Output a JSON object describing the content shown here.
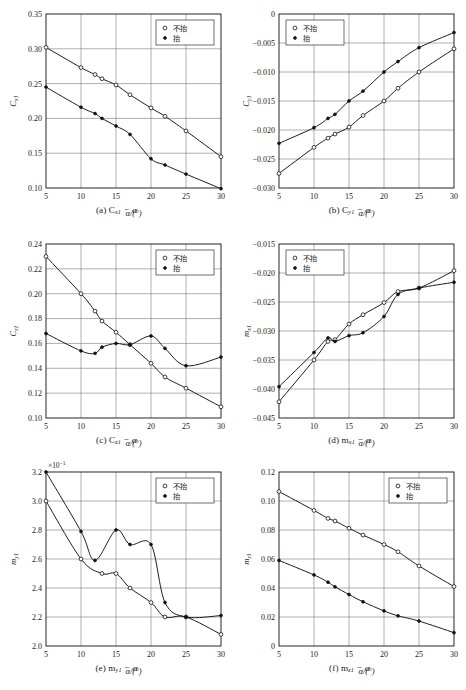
{
  "figure": {
    "panel_count": 6,
    "legend": {
      "open_label": "不抬",
      "filled_label": "抬"
    },
    "x_axis_title": "α/(°)",
    "series_names": [
      "不抬",
      "抬"
    ]
  },
  "captions": {
    "a": "(a) C",
    "a_sub": "x1",
    "a_tail": " − α",
    "b": "(b) C",
    "b_sub": "y1",
    "b_tail": " − α",
    "c": "(c) C",
    "c_sub": "z1",
    "c_tail": " − α",
    "d": "(d) m",
    "d_sub": "x1",
    "d_tail": " − α",
    "e": "(e) m",
    "e_sub": "y1",
    "e_tail": " − α",
    "f": "(f) m",
    "f_sub": "z1",
    "f_tail": " − α"
  },
  "chart_data": [
    {
      "id": "a",
      "type": "line",
      "title": "(a) Cx1 − α",
      "xlabel": "α/(°)",
      "ylabel": "C",
      "ylabel_sub": "x1",
      "xlim": [
        5,
        30
      ],
      "ylim": [
        0.1,
        0.35
      ],
      "xticks": [
        5,
        10,
        15,
        20,
        25,
        30
      ],
      "yticks": [
        0.1,
        0.15,
        0.2,
        0.25,
        0.3,
        0.35
      ],
      "ytick_labels": [
        "0.10",
        "0.15",
        "0.20",
        "0.25",
        "0.30",
        "0.35"
      ],
      "grid": true,
      "legend_position": "top-right",
      "multiplier": "",
      "series": [
        {
          "name": "不抬",
          "marker": "open-circle",
          "x": [
            5,
            10,
            12,
            13,
            15,
            17,
            20,
            22,
            25,
            30
          ],
          "values": [
            0.302,
            0.273,
            0.263,
            0.257,
            0.248,
            0.234,
            0.215,
            0.203,
            0.182,
            0.145
          ]
        },
        {
          "name": "抬",
          "marker": "filled-circle",
          "x": [
            5,
            10,
            12,
            13,
            15,
            17,
            20,
            22,
            25,
            30
          ],
          "values": [
            0.245,
            0.216,
            0.207,
            0.2,
            0.189,
            0.177,
            0.142,
            0.133,
            0.12,
            0.099
          ]
        }
      ]
    },
    {
      "id": "b",
      "type": "line",
      "title": "(b) Cy1 − α",
      "xlabel": "α/(°)",
      "ylabel": "C",
      "ylabel_sub": "y1",
      "xlim": [
        5,
        30
      ],
      "ylim": [
        -0.03,
        0
      ],
      "xticks": [
        5,
        10,
        15,
        20,
        25,
        30
      ],
      "yticks": [
        -0.03,
        -0.025,
        -0.02,
        -0.015,
        -0.01,
        -0.005,
        0
      ],
      "ytick_labels": [
        "−0.030",
        "−0.025",
        "−0.020",
        "−0.015",
        "−0.010",
        "−0.005",
        "0"
      ],
      "grid": true,
      "legend_position": "top-left",
      "multiplier": "",
      "series": [
        {
          "name": "不抬",
          "marker": "open-circle",
          "x": [
            5,
            10,
            12,
            13,
            15,
            17,
            20,
            22,
            25,
            30
          ],
          "values": [
            -0.0275,
            -0.023,
            -0.0214,
            -0.0207,
            -0.0195,
            -0.0175,
            -0.015,
            -0.0128,
            -0.01,
            -0.006
          ]
        },
        {
          "name": "抬",
          "marker": "filled-circle",
          "x": [
            5,
            10,
            12,
            13,
            15,
            17,
            20,
            22,
            25,
            30
          ],
          "values": [
            -0.0223,
            -0.0196,
            -0.018,
            -0.0173,
            -0.015,
            -0.0133,
            -0.01,
            -0.0082,
            -0.0058,
            -0.0032
          ]
        }
      ]
    },
    {
      "id": "c",
      "type": "line",
      "title": "(c) Cz1 − α",
      "xlabel": "α/(°)",
      "ylabel": "C",
      "ylabel_sub": "z1",
      "xlim": [
        5,
        30
      ],
      "ylim": [
        0.1,
        0.24
      ],
      "xticks": [
        5,
        10,
        15,
        20,
        25,
        30
      ],
      "yticks": [
        0.1,
        0.12,
        0.14,
        0.16,
        0.18,
        0.2,
        0.22,
        0.24
      ],
      "ytick_labels": [
        "0.10",
        "0.12",
        "0.14",
        "0.16",
        "0.18",
        "0.20",
        "0.22",
        "0.24"
      ],
      "grid": true,
      "legend_position": "top-right",
      "multiplier": "",
      "series": [
        {
          "name": "不抬",
          "marker": "open-circle",
          "x": [
            5,
            10,
            12,
            13,
            15,
            17,
            20,
            22,
            25,
            30
          ],
          "values": [
            0.23,
            0.2,
            0.186,
            0.178,
            0.169,
            0.159,
            0.144,
            0.133,
            0.124,
            0.109
          ]
        },
        {
          "name": "抬",
          "marker": "filled-circle",
          "x": [
            5,
            10,
            12,
            13,
            15,
            17,
            20,
            22,
            25,
            30
          ],
          "values": [
            0.168,
            0.154,
            0.152,
            0.157,
            0.16,
            0.159,
            0.166,
            0.156,
            0.142,
            0.149
          ]
        }
      ]
    },
    {
      "id": "d",
      "type": "line",
      "title": "(d) mx1 − α",
      "xlabel": "α/(°)",
      "ylabel": "m",
      "ylabel_sub": "x1",
      "xlim": [
        5,
        30
      ],
      "ylim": [
        -0.045,
        -0.015
      ],
      "xticks": [
        5,
        10,
        15,
        20,
        25,
        30
      ],
      "yticks": [
        -0.045,
        -0.04,
        -0.035,
        -0.03,
        -0.025,
        -0.02,
        -0.015
      ],
      "ytick_labels": [
        "−0.045",
        "−0.040",
        "−0.035",
        "−0.030",
        "−0.025",
        "−0.020",
        "−0.015"
      ],
      "grid": true,
      "legend_position": "top-left",
      "multiplier": "",
      "series": [
        {
          "name": "不抬",
          "marker": "open-circle",
          "x": [
            5,
            10,
            12,
            13,
            15,
            17,
            20,
            22,
            25,
            30
          ],
          "values": [
            -0.0422,
            -0.035,
            -0.0318,
            -0.0315,
            -0.0288,
            -0.0272,
            -0.0251,
            -0.0232,
            -0.0226,
            -0.0196
          ]
        },
        {
          "name": "抬",
          "marker": "filled-circle",
          "x": [
            5,
            10,
            12,
            13,
            15,
            17,
            20,
            22,
            25,
            30
          ],
          "values": [
            -0.0396,
            -0.0337,
            -0.0312,
            -0.0318,
            -0.0308,
            -0.0303,
            -0.0275,
            -0.0237,
            -0.0226,
            -0.0216
          ]
        }
      ]
    },
    {
      "id": "e",
      "type": "line",
      "title": "(e) my1 − α",
      "xlabel": "α/(°)",
      "ylabel": "m",
      "ylabel_sub": "y1",
      "xlim": [
        5,
        30
      ],
      "ylim": [
        2.0,
        3.2
      ],
      "xticks": [
        5,
        10,
        15,
        20,
        25,
        30
      ],
      "yticks": [
        2.0,
        2.2,
        2.4,
        2.6,
        2.8,
        3.0,
        3.2
      ],
      "ytick_labels": [
        "2.0",
        "2.2",
        "2.4",
        "2.6",
        "2.8",
        "3.0",
        "3.2"
      ],
      "grid": true,
      "legend_position": "top-right",
      "multiplier": "×10",
      "multiplier_exp": "−1",
      "series": [
        {
          "name": "不抬",
          "marker": "open-circle",
          "x": [
            5,
            10,
            13,
            15,
            17,
            20,
            22,
            25,
            30
          ],
          "values": [
            3.0,
            2.6,
            2.5,
            2.5,
            2.4,
            2.3,
            2.2,
            2.2,
            2.08
          ]
        },
        {
          "name": "抬",
          "marker": "filled-circle",
          "x": [
            5,
            10,
            12,
            15,
            17,
            20,
            22,
            25,
            30
          ],
          "values": [
            3.2,
            2.79,
            2.59,
            2.8,
            2.7,
            2.7,
            2.3,
            2.2,
            2.21
          ]
        }
      ]
    },
    {
      "id": "f",
      "type": "line",
      "title": "(f) mz1 − α",
      "xlabel": "α/(°)",
      "ylabel": "m",
      "ylabel_sub": "z1",
      "xlim": [
        5,
        30
      ],
      "ylim": [
        0,
        0.12
      ],
      "xticks": [
        5,
        10,
        15,
        20,
        25,
        30
      ],
      "yticks": [
        0,
        0.02,
        0.04,
        0.06,
        0.08,
        0.1,
        0.12
      ],
      "ytick_labels": [
        "0",
        "0.02",
        "0.04",
        "0.06",
        "0.08",
        "0.10",
        "0.12"
      ],
      "grid": true,
      "legend_position": "top-right",
      "multiplier": "",
      "series": [
        {
          "name": "不抬",
          "marker": "open-circle",
          "x": [
            5,
            10,
            12,
            13,
            15,
            17,
            20,
            22,
            25,
            30
          ],
          "values": [
            0.1065,
            0.0935,
            0.088,
            0.0862,
            0.0812,
            0.0765,
            0.07,
            0.065,
            0.0552,
            0.041
          ]
        },
        {
          "name": "抬",
          "marker": "filled-circle",
          "x": [
            5,
            10,
            12,
            13,
            15,
            17,
            20,
            22,
            25,
            30
          ],
          "values": [
            0.059,
            0.049,
            0.044,
            0.0408,
            0.0355,
            0.0305,
            0.0242,
            0.0208,
            0.0172,
            0.0092
          ]
        }
      ]
    }
  ]
}
